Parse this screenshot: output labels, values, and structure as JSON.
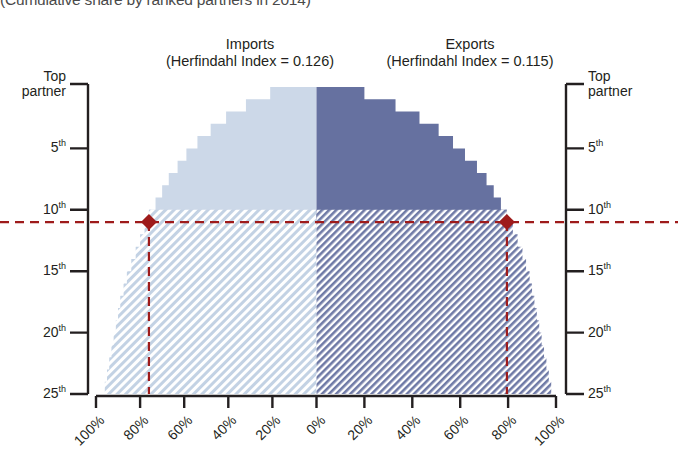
{
  "title": "(Cumulative share by ranked partners in 2014)",
  "panels": {
    "imports": {
      "name": "Imports",
      "metric": "(Herfindahl Index = 0.126)"
    },
    "exports": {
      "name": "Exports",
      "metric": "(Herfindahl Index = 0.115)"
    }
  },
  "axes": {
    "left_title": "Top partner",
    "right_title": "Top partner",
    "rank_ticks": [
      "5",
      "10",
      "15",
      "20",
      "25"
    ],
    "ordinal_suffix": "th",
    "x_left_ticks": [
      "100%",
      "80%",
      "60%",
      "40%",
      "20%",
      "0%"
    ],
    "x_right_ticks": [
      "20%",
      "40%",
      "60%",
      "80%",
      "100%"
    ]
  },
  "colors": {
    "imports_fill": "#ccd8e8",
    "exports_fill": "#6671a0",
    "imports_hatch": "#c3d2e4",
    "exports_hatch": "#6f7aa6",
    "marker": "#9e1b1b",
    "axis": "#231f20"
  },
  "markers": {
    "imports_label": "11th partner reference",
    "exports_label": "11th partner reference",
    "rank": "11"
  },
  "chart_data": {
    "type": "area",
    "title": "(Cumulative share by ranked partners in 2014)",
    "xlabel": "",
    "ylabel": "Ranked partner",
    "orientation": "butterfly-horizontal",
    "xlim": [
      0,
      100
    ],
    "ylim": [
      1,
      25
    ],
    "grid": false,
    "legend_position": "top",
    "categories": [
      "Top partner",
      "2nd",
      "3rd",
      "4th",
      "5th",
      "6th",
      "7th",
      "8th",
      "9th",
      "10th",
      "11th",
      "12th",
      "13th",
      "14th",
      "15th",
      "16th",
      "17th",
      "18th",
      "19th",
      "20th",
      "21st",
      "22nd",
      "23rd",
      "24th",
      "25th"
    ],
    "series": [
      {
        "name": "Imports",
        "metric_label": "Herfindahl Index = 0.126",
        "direction": "left",
        "values": [
          21,
          32,
          41,
          48,
          54,
          59,
          63,
          67,
          70,
          73,
          76,
          78,
          80,
          82,
          84,
          86,
          87.5,
          89,
          90,
          91,
          92,
          93,
          94,
          95,
          96
        ]
      },
      {
        "name": "Exports",
        "metric_label": "Herfindahl Index = 0.115",
        "direction": "right",
        "values": [
          20,
          33,
          43,
          51,
          57,
          62,
          67,
          71,
          74,
          77,
          79.5,
          82,
          84,
          86,
          87.5,
          89,
          90,
          91,
          92,
          93,
          94,
          95,
          96,
          97,
          98
        ]
      }
    ],
    "reference_line": {
      "rank": 11,
      "imports_value": 76,
      "exports_value": 79.5,
      "style": "dashed",
      "color": "#9e1b1b"
    }
  }
}
